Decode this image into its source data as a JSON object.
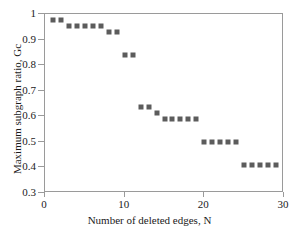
{
  "chart_data": {
    "type": "scatter",
    "title": "",
    "xlabel": "Number of deleted edges, N",
    "ylabel": "Maximum subgraph ratio, Gc",
    "xlim": [
      0,
      30
    ],
    "ylim": [
      0.3,
      1.0
    ],
    "xticks": [
      0,
      10,
      20,
      30
    ],
    "xtick_labels": [
      "0",
      "10",
      "20",
      "30"
    ],
    "yticks": [
      0.3,
      0.4,
      0.5,
      0.6,
      0.7,
      0.8,
      0.9,
      1.0
    ],
    "ytick_labels": [
      "0.3",
      "0.4",
      "0.5",
      "0.6",
      "0.7",
      "0.8",
      "0.9",
      "1"
    ],
    "grid": false,
    "legend": false,
    "marker": {
      "shape": "square",
      "color": "#5c5c5c",
      "size_px": 5
    },
    "series": [
      {
        "name": "Maximum subgraph ratio",
        "x": [
          1,
          2,
          3,
          4,
          5,
          6,
          7,
          8,
          9,
          10,
          11,
          12,
          13,
          14,
          15,
          16,
          17,
          18,
          19,
          20,
          21,
          22,
          23,
          24,
          25,
          26,
          27,
          28,
          29
        ],
        "y": [
          0.975,
          0.975,
          0.953,
          0.953,
          0.953,
          0.953,
          0.953,
          0.931,
          0.931,
          0.841,
          0.841,
          0.636,
          0.636,
          0.613,
          0.59,
          0.59,
          0.59,
          0.59,
          0.59,
          0.5,
          0.5,
          0.5,
          0.5,
          0.5,
          0.409,
          0.409,
          0.409,
          0.409,
          0.409
        ]
      }
    ]
  }
}
